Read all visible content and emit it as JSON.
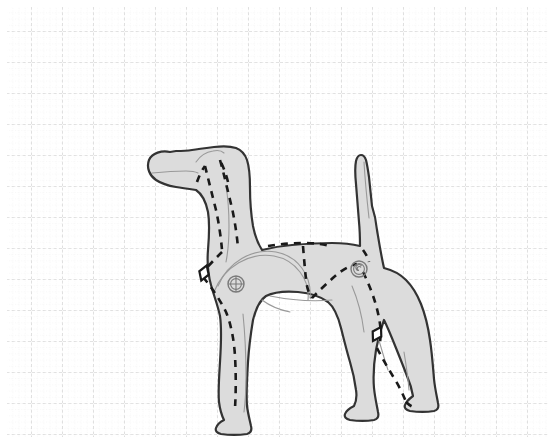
{
  "canvas": {
    "width": 555,
    "height": 444,
    "background_color": "#ffffff",
    "title": "Dog Anatomy Rigging Diagram"
  },
  "grid": {
    "name": "dotted-graph-grid",
    "major_spacing": 31,
    "minor_spacing": 6.2,
    "major_color": "#c9c9c9",
    "minor_color": "#e2e2e2",
    "origin_x": 7,
    "origin_y": 7,
    "margin": 7,
    "style": "dashed"
  },
  "figure": {
    "name": "dog-silhouette",
    "pose": "standing-side-profile",
    "facing": "left",
    "fill_color": "#dcdcdc",
    "outline_color": "#333333",
    "outline_width": 2.2,
    "interior_line_color": "#999999",
    "interior_line_width": 1.1,
    "body_outline_path": "M 170 152 C 162 150 152 153 149 160 C 146 168 150 176 156 180 C 162 184 170 186 176 187 C 182 188 189 189 196 190 C 202 194 206 202 208 212 C 210 224 209 238 208 250 C 207 262 208 274 211 285 C 214 296 218 306 220 316 C 222 330 221 346 220 362 C 219 378 218 392 219 402 C 220 410 222 416 224 420 C 220 422 217 425 216 428 C 215 431 217 433 221 434 C 228 435 240 435 247 434 C 251 433 252 430 251 426 C 250 421 248 414 247 406 C 246 394 247 378 248 362 C 249 346 251 332 253 320 C 256 308 260 300 266 296 C 274 292 286 291 298 292 C 310 293 320 296 328 302 C 334 307 338 316 341 328 C 344 340 347 352 350 362 C 353 372 355 382 356 390 C 357 396 356 402 354 406 C 350 408 346 411 345 414 C 344 417 346 419 350 420 C 357 421 368 421 374 420 C 378 419 379 416 378 412 C 377 406 375 398 374 388 C 373 376 374 362 376 350 C 378 338 381 328 384 320 C 388 328 392 338 396 348 C 400 358 404 368 407 376 C 410 383 412 390 413 396 C 409 399 406 402 405 405 C 404 408 406 410 410 411 C 417 412 428 412 434 411 C 438 410 439 407 438 403 C 437 397 435 389 434 379 C 433 367 432 353 430 340 C 428 326 425 314 421 304 C 417 294 412 286 406 280 C 400 274 392 270 384 268 C 381 255 379 242 377 230 C 376 220 374 212 372 206 C 371 196 370 186 369 177 C 368 170 367 164 366 160 C 365 157 363 155 361 155 C 359 155 357 157 356 161 C 355 166 355 174 356 184 C 357 196 358 210 359 222 C 360 232 360 240 360 246 C 352 244 342 243 332 243 C 318 243 304 244 292 245 C 280 246 270 248 262 250 C 258 244 255 236 253 226 C 251 214 250 200 250 188 C 250 176 249 166 247 160 C 245 154 241 150 236 148 C 230 146 222 146 214 147 C 206 148 198 149 192 150 C 186 151 180 151 176 151 Z",
    "interior_lines": [
      {
        "name": "muzzle-mouth-line",
        "path": "M 152 173 C 162 172 175 171 186 171 C 192 171 196 172 198 173"
      },
      {
        "name": "ear-crease-line",
        "path": "M 196 162 C 200 156 206 152 213 151 C 218 150 222 151 224 153"
      },
      {
        "name": "neck-front-line",
        "path": "M 226 186 C 228 198 229 212 229 226 C 229 240 228 252 226 262"
      },
      {
        "name": "shoulder-blade-arc",
        "path": "M 218 286 C 228 262 252 248 276 252 C 298 256 312 276 310 298"
      },
      {
        "name": "shoulder-blade-arc-2",
        "path": "M 214 292 C 224 266 250 252 274 256 C 296 260 310 280 308 300"
      },
      {
        "name": "chest-line",
        "path": "M 262 300 C 270 306 280 310 290 312"
      },
      {
        "name": "front-leg-back-line",
        "path": "M 243 314 C 245 334 246 356 246 376 C 246 392 245 404 244 412"
      },
      {
        "name": "rear-thigh-line",
        "path": "M 352 286 C 358 300 362 316 364 332"
      },
      {
        "name": "rear-leg-inner-line",
        "path": "M 376 330 C 380 344 384 358 388 370"
      },
      {
        "name": "belly-line",
        "path": "M 270 296 C 290 300 312 302 332 300"
      },
      {
        "name": "tail-inner-line",
        "path": "M 364 162 C 365 180 367 200 369 218"
      },
      {
        "name": "rear-hock-line",
        "path": "M 404 352 C 406 364 408 378 409 390"
      }
    ],
    "construction_lines": [
      {
        "name": "skull-dash-left",
        "path": "M 197 182 C 199 176 202 170 205 166",
        "dash": "7 6"
      },
      {
        "name": "skull-dash-right",
        "path": "M 228 182 C 226 174 223 166 220 160",
        "dash": "7 6"
      },
      {
        "name": "spine-neck-dash",
        "path": "M 205 166 C 208 178 212 194 216 210 C 219 224 221 238 222 250",
        "dash": "7 6"
      },
      {
        "name": "spine-neck-dash-2",
        "path": "M 220 160 C 224 174 228 192 232 208 C 235 222 237 236 238 248",
        "dash": "7 6"
      },
      {
        "name": "shoulder-to-elbow-dash",
        "path": "M 222 252 C 216 258 210 264 205 270",
        "dash": "7 6"
      },
      {
        "name": "elbow-to-foreleg-dash",
        "path": "M 203 277 C 212 288 220 300 226 312 C 231 324 234 340 235 356 C 236 374 236 392 235 408",
        "dash": "7 6"
      },
      {
        "name": "back-topline-dash",
        "path": "M 268 246 C 280 244 292 243 304 243 C 314 243 322 244 330 246",
        "dash": "7 6"
      },
      {
        "name": "loin-vertical-dash",
        "path": "M 303 246 C 304 258 305 270 306 280 C 307 288 309 294 312 298",
        "dash": "7 6"
      },
      {
        "name": "croup-to-hip-dash",
        "path": "M 312 298 C 320 290 330 280 340 272 C 346 268 352 265 357 264",
        "dash": "7 6"
      },
      {
        "name": "tail-base-dash",
        "path": "M 363 250 C 366 254 368 258 369 262",
        "dash": "7 6"
      },
      {
        "name": "hip-to-stifle-dash",
        "path": "M 363 272 C 370 286 376 302 379 318 C 381 328 381 336 380 342",
        "dash": "7 6"
      },
      {
        "name": "stifle-to-hock-dash",
        "path": "M 377 348 C 382 358 388 368 394 378 C 399 386 403 394 406 402",
        "dash": "7 6"
      },
      {
        "name": "hock-to-paw-dash",
        "path": "M 406 402 C 409 405 412 407 416 408",
        "dash": "7 6"
      }
    ],
    "joint_markers": [
      {
        "name": "shoulder-joint-marker",
        "type": "circle-crosshair",
        "cx": 236,
        "cy": 284,
        "r": 8
      },
      {
        "name": "hip-joint-marker",
        "type": "circle-spiral",
        "cx": 359,
        "cy": 269,
        "r": 8
      }
    ],
    "pivot_markers": [
      {
        "name": "elbow-pivot-marker",
        "type": "diamond",
        "cx": 204,
        "cy": 273,
        "size": 8,
        "rotation": 20
      },
      {
        "name": "stifle-pivot-marker",
        "type": "diamond",
        "cx": 377,
        "cy": 334,
        "size": 8,
        "rotation": 30
      }
    ]
  }
}
